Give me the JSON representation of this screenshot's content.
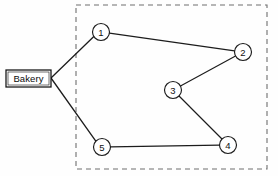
{
  "diagram": {
    "depot": {
      "label": "Bakery",
      "name": "depot-bakery",
      "x": 28.5,
      "y": 78,
      "box": {
        "x": 6,
        "y": 70,
        "width": 45,
        "height": 17
      }
    },
    "zone": {
      "name": "service-area-boundary",
      "x": 76,
      "y": 5,
      "width": 191,
      "height": 164,
      "style": "dashed",
      "color": "#6e6e6e"
    },
    "nodes": [
      {
        "id": "1",
        "label": "1",
        "x": 101,
        "y": 32,
        "r": 8.5
      },
      {
        "id": "2",
        "label": "2",
        "x": 243,
        "y": 52,
        "r": 8.5
      },
      {
        "id": "3",
        "label": "3",
        "x": 173,
        "y": 90,
        "r": 8.5
      },
      {
        "id": "4",
        "label": "4",
        "x": 228,
        "y": 145,
        "r": 8.5
      },
      {
        "id": "5",
        "label": "5",
        "x": 102,
        "y": 147,
        "r": 8.5
      }
    ],
    "edges": [
      {
        "from": "depot",
        "to": "1",
        "kind": "depot"
      },
      {
        "from": "depot",
        "to": "5",
        "kind": "depot"
      },
      {
        "from": "1",
        "to": "2",
        "kind": "route"
      },
      {
        "from": "2",
        "to": "3",
        "kind": "route"
      },
      {
        "from": "3",
        "to": "4",
        "kind": "route"
      },
      {
        "from": "4",
        "to": "5",
        "kind": "route"
      }
    ],
    "colors": {
      "line": "#1c1c1c",
      "boundary": "#6e6e6e",
      "node_fill": "#ffffff",
      "background": "#fefefe"
    }
  }
}
